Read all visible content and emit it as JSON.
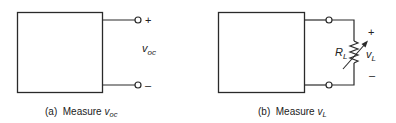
{
  "diagrams": [
    {
      "id": "a",
      "caption_prefix": "(a)  Measure ",
      "caption_var": "v",
      "caption_sub": "oc",
      "voltage_label_var": "v",
      "voltage_label_sub": "oc",
      "plus": "+",
      "minus": "–"
    },
    {
      "id": "b",
      "caption_prefix": "(b)  Measure ",
      "caption_var": "v",
      "caption_sub": "L",
      "resistor_label_var": "R",
      "resistor_label_sub": "L",
      "voltage_label_var": "v",
      "voltage_label_sub": "L",
      "plus": "+",
      "minus": "–"
    }
  ],
  "colors": {
    "line": "#2a2a2a",
    "background": "#ffffff"
  }
}
